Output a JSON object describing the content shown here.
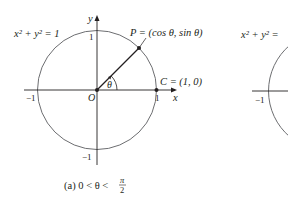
{
  "figure_a": {
    "equation": "x² + y² = 1",
    "point_p_label": "P = (cos θ, sin θ)",
    "point_c_label": "C = (1, 0)",
    "origin_label": "O",
    "x_axis_label": "x",
    "y_axis_label": "y",
    "angle_label": "θ",
    "tick_x_neg": "−1",
    "tick_x_pos": "1",
    "tick_y_pos": "1",
    "tick_y_neg": "−1",
    "caption_prefix": "(a)  0 < θ <",
    "caption_frac_num": "π",
    "caption_frac_den": "2"
  },
  "figure_b": {
    "equation": "x² + y² =",
    "tick_x_neg": "−1"
  },
  "colors": {
    "circle": "#6d6e71",
    "axis": "#231f20",
    "text": "#231f20"
  }
}
